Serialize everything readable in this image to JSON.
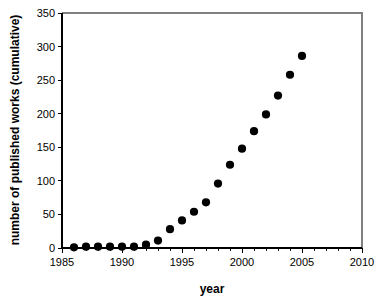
{
  "chart_data": {
    "type": "scatter",
    "title": "",
    "xlabel": "year",
    "ylabel": "number of published works (cumulative)",
    "xlim": [
      1985,
      2010
    ],
    "ylim": [
      0,
      350
    ],
    "xticks": [
      1985,
      1990,
      1995,
      2000,
      2005,
      2010
    ],
    "xtick_labels": [
      "1985",
      "1990",
      "1995",
      "2000",
      "2005",
      "2010"
    ],
    "yticks": [
      0,
      50,
      100,
      150,
      200,
      250,
      300,
      350
    ],
    "ytick_labels": [
      "0",
      "50",
      "100",
      "150",
      "200",
      "250",
      "300",
      "350"
    ],
    "x_minor_tick_interval": 1,
    "grid": false,
    "legend": false,
    "marker": "circle",
    "marker_color": "#000000",
    "marker_size": 5,
    "series": [
      {
        "name": "cumulative published works",
        "x": [
          1986,
          1987,
          1988,
          1989,
          1990,
          1991,
          1992,
          1993,
          1994,
          1995,
          1996,
          1997,
          1998,
          1999,
          2000,
          2001,
          2002,
          2003,
          2004,
          2005
        ],
        "values": [
          1,
          2,
          2,
          2,
          2,
          2,
          5,
          11,
          28,
          41,
          54,
          68,
          96,
          124,
          148,
          174,
          199,
          227,
          258,
          286
        ]
      }
    ]
  }
}
